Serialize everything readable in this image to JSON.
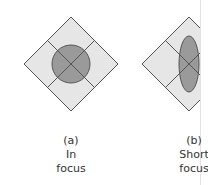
{
  "figures": [
    {
      "id": "a",
      "label": "(a)",
      "caption_line1": "In",
      "caption_line2": "focus",
      "spot_shape": "circle"
    },
    {
      "id": "b",
      "label": "(b)",
      "caption_line1": "Short",
      "caption_line2": "focus",
      "spot_shape": "vertical-ellipse"
    }
  ],
  "colors": {
    "quadrant_fill": "#e6e6e6",
    "spot_fill": "#9a9a9a",
    "stroke": "#555555"
  }
}
